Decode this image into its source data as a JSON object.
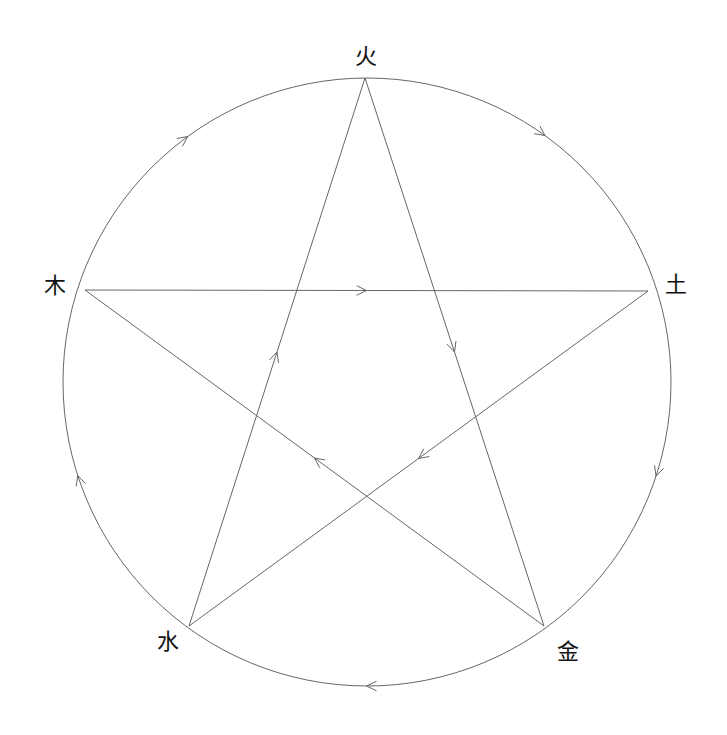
{
  "diagram": {
    "colors": {
      "line": "#666666",
      "text": "#111111",
      "background": "#ffffff"
    },
    "circle": {
      "cx": 367,
      "cy": 382,
      "r": 304
    },
    "nodes": [
      {
        "id": "fire",
        "label": "火",
        "x": 365,
        "y": 78,
        "label_x": 366,
        "label_y": 57
      },
      {
        "id": "earth",
        "label": "土",
        "x": 648,
        "y": 291,
        "label_x": 676,
        "label_y": 285
      },
      {
        "id": "metal",
        "label": "金",
        "x": 544,
        "y": 626,
        "label_x": 568,
        "label_y": 652
      },
      {
        "id": "water",
        "label": "水",
        "x": 189,
        "y": 626,
        "label_x": 168,
        "label_y": 642
      },
      {
        "id": "wood",
        "label": "木",
        "x": 85,
        "y": 290,
        "label_x": 55,
        "label_y": 286
      }
    ],
    "generating_cycle": {
      "description": "Outer circle, clockwise arrows",
      "edges": [
        {
          "from": "fire",
          "to": "earth"
        },
        {
          "from": "earth",
          "to": "metal"
        },
        {
          "from": "metal",
          "to": "water"
        },
        {
          "from": "water",
          "to": "wood"
        },
        {
          "from": "wood",
          "to": "fire"
        }
      ]
    },
    "overcoming_cycle": {
      "description": "Inner pentagram, straight arrows",
      "edges": [
        {
          "from": "wood",
          "to": "earth"
        },
        {
          "from": "fire",
          "to": "metal"
        },
        {
          "from": "earth",
          "to": "water"
        },
        {
          "from": "metal",
          "to": "wood"
        },
        {
          "from": "water",
          "to": "fire"
        }
      ]
    }
  }
}
